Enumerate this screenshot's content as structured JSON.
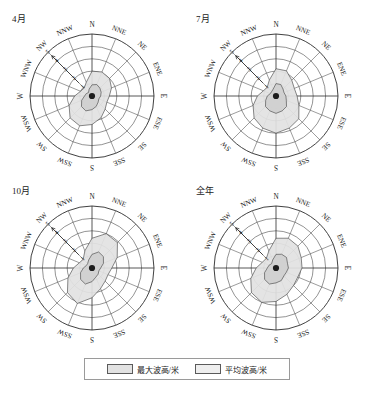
{
  "figure": {
    "background_color": "#ffffff",
    "panel_count": 4
  },
  "legend": {
    "items": [
      {
        "label": "最大波高/米",
        "swatch_color": "#e2e2e2",
        "swatch_name": "max-wave-height-swatch"
      },
      {
        "label": "平均波高/米",
        "swatch_color": "#eeeeee",
        "swatch_name": "avg-wave-height-swatch"
      }
    ]
  },
  "chart_data": {
    "type": "line",
    "chart_subtype": "wind-rose-radar",
    "title": "",
    "directions": [
      "N",
      "NNE",
      "NE",
      "ENE",
      "E",
      "ESE",
      "SE",
      "SSE",
      "S",
      "SSW",
      "SW",
      "WSW",
      "W",
      "WNW",
      "NW",
      "NNW"
    ],
    "radial_ticks": [
      1,
      2,
      3,
      4,
      5
    ],
    "radial_tick_labels": [
      "1",
      "2",
      "3",
      "4",
      "5"
    ],
    "rlim": [
      0,
      5
    ],
    "ylabel": "波高/米",
    "grid": true,
    "legend_position": "bottom",
    "ring_count": 5,
    "spoke_count": 16,
    "panels": [
      {
        "title": "4月",
        "series": [
          {
            "name": "最大波高/米",
            "values": [
              2.0,
              2.1,
              2.0,
              1.7,
              1.4,
              1.3,
              1.5,
              1.9,
              2.3,
              2.6,
              2.5,
              2.0,
              1.4,
              1.0,
              0.9,
              1.2
            ]
          },
          {
            "name": "平均波高/米",
            "values": [
              0.9,
              1.0,
              0.9,
              0.8,
              0.7,
              0.6,
              0.7,
              0.9,
              1.1,
              1.3,
              1.2,
              0.9,
              0.6,
              0.5,
              0.4,
              0.6
            ]
          }
        ]
      },
      {
        "title": "7月",
        "series": [
          {
            "name": "最大波高/米",
            "values": [
              2.2,
              2.2,
              1.8,
              1.6,
              1.7,
              2.0,
              2.6,
              2.8,
              3.0,
              2.8,
              2.5,
              2.0,
              1.5,
              1.1,
              1.0,
              1.4
            ]
          },
          {
            "name": "平均波高/米",
            "values": [
              1.0,
              1.0,
              0.8,
              0.7,
              0.8,
              0.9,
              1.2,
              1.3,
              1.4,
              1.3,
              1.2,
              0.9,
              0.7,
              0.5,
              0.5,
              0.6
            ]
          }
        ]
      },
      {
        "title": "10月",
        "series": [
          {
            "name": "最大波高/米",
            "values": [
              2.4,
              3.0,
              2.9,
              2.2,
              1.6,
              1.4,
              1.5,
              1.8,
              2.4,
              3.1,
              2.8,
              2.1,
              1.5,
              1.1,
              1.0,
              1.5
            ]
          },
          {
            "name": "平均波高/米",
            "values": [
              1.1,
              1.4,
              1.3,
              1.0,
              0.7,
              0.6,
              0.7,
              0.8,
              1.1,
              1.4,
              1.3,
              1.0,
              0.7,
              0.5,
              0.5,
              0.7
            ]
          }
        ]
      },
      {
        "title": "全年",
        "series": [
          {
            "name": "最大波高/米",
            "values": [
              2.4,
              2.6,
              2.5,
              2.2,
              2.1,
              1.9,
              2.0,
              2.3,
              2.7,
              3.0,
              2.8,
              2.2,
              1.6,
              1.2,
              1.1,
              1.5
            ]
          },
          {
            "name": "平均波高/米",
            "values": [
              1.1,
              1.2,
              1.2,
              1.0,
              1.0,
              0.9,
              0.9,
              1.1,
              1.2,
              1.4,
              1.3,
              1.0,
              0.7,
              0.6,
              0.5,
              0.7
            ]
          }
        ]
      }
    ]
  }
}
